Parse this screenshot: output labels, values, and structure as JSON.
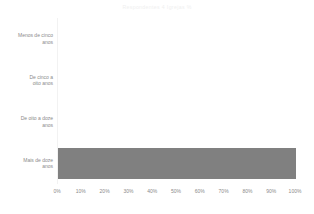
{
  "chart_data": {
    "type": "bar",
    "orientation": "horizontal",
    "title": "Respondentes 4 Igrejas %",
    "xlabel": "",
    "ylabel": "",
    "categories": [
      "Menos de cinco anos",
      "De cinco a oito anos",
      "De oito a doze anos",
      "Mais de doze anos"
    ],
    "category_lines": [
      [
        "Menos de cinco",
        "anos"
      ],
      [
        "De cinco a",
        "oito anos"
      ],
      [
        "De oito a doze",
        "anos"
      ],
      [
        "Mais de doze",
        "anos"
      ]
    ],
    "values": [
      0,
      0,
      0,
      100
    ],
    "xlim": [
      0,
      100
    ],
    "xticks": [
      0,
      10,
      20,
      30,
      40,
      50,
      60,
      70,
      80,
      90,
      100
    ],
    "xtick_labels": [
      "0%",
      "10%",
      "20%",
      "30%",
      "40%",
      "50%",
      "60%",
      "70%",
      "80%",
      "90%",
      "100%"
    ],
    "grid": false,
    "legend": null,
    "bar_color": "#808080",
    "title_color": "#efefef",
    "tick_color": "#8a8a8a",
    "background": "#ffffff"
  }
}
